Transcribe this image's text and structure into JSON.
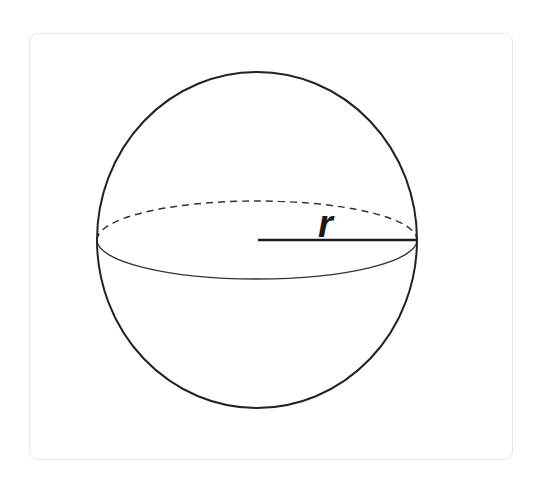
{
  "diagram": {
    "shape": "sphere",
    "radius_label": "r",
    "colors": {
      "background": "#ffffff",
      "card_border": "#e6e6e6",
      "stroke": "#222222",
      "equator_stroke": "#333333",
      "label": "#1a1a1a"
    },
    "elements": [
      {
        "name": "sphere-outline",
        "type": "ellipse",
        "cx": 257,
        "cy": 240,
        "rx": 160,
        "ry": 168,
        "style": "solid"
      },
      {
        "name": "equator-back",
        "type": "half-ellipse",
        "cx": 257,
        "cy": 240,
        "rx": 160,
        "ry": 39,
        "style": "dashed"
      },
      {
        "name": "equator-front",
        "type": "half-ellipse",
        "cx": 257,
        "cy": 240,
        "rx": 160,
        "ry": 39,
        "style": "solid"
      },
      {
        "name": "radius-line",
        "type": "line",
        "from": [
          258,
          240
        ],
        "to": [
          417,
          240
        ],
        "label": "r"
      }
    ]
  }
}
